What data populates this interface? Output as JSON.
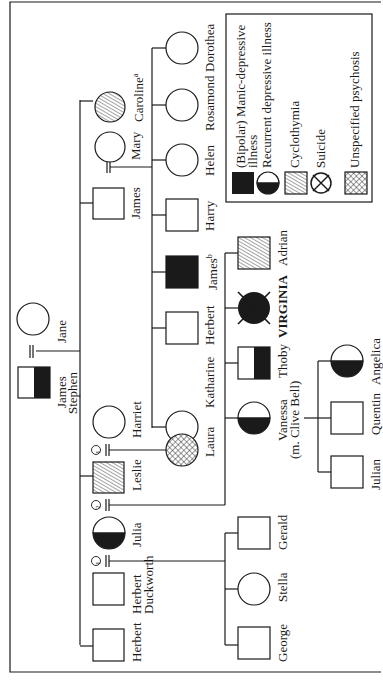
{
  "legend": {
    "items": [
      {
        "symbol": "filled-square",
        "label_line1": "(Bipolar) Manic-depressive",
        "label_line2": "illness"
      },
      {
        "symbol": "half-filled-circle",
        "label_line1": "Recurrent depressive illness"
      },
      {
        "symbol": "hatched-square",
        "label_line1": "Cyclothymia"
      },
      {
        "symbol": "crossed-circle",
        "label_line1": "Suicide"
      },
      {
        "symbol": "crosshatched-square",
        "label_line1": "Unspecified psychosis"
      }
    ]
  },
  "people": {
    "james_stephen": {
      "name1": "James",
      "name2": "Stephen",
      "sex": "male",
      "status": "recurrent-depressive"
    },
    "jane": {
      "name": "Jane",
      "sex": "female",
      "status": "unaffected"
    },
    "caroline": {
      "name": "Caroline",
      "sup": "a",
      "sex": "female",
      "status": "cyclothymia"
    },
    "mary": {
      "name": "Mary",
      "sex": "female",
      "status": "unaffected"
    },
    "james": {
      "name": "James",
      "sex": "male",
      "status": "unaffected"
    },
    "harriet": {
      "name": "Harriet",
      "sex": "female",
      "status": "unaffected"
    },
    "leslie": {
      "name": "Leslie",
      "sex": "male",
      "status": "cyclothymia"
    },
    "julia": {
      "name": "Julia",
      "sex": "female",
      "status": "recurrent-depressive"
    },
    "herbert_duckworth": {
      "name1": "Herbert",
      "name2": "Duckworth",
      "sex": "male",
      "status": "unaffected"
    },
    "herbert_sib": {
      "name": "Herbert",
      "sex": "male",
      "status": "unaffected"
    },
    "dorothea": {
      "name": "Dorothea",
      "sex": "female",
      "status": "unaffected"
    },
    "rosamond": {
      "name": "Rosamond",
      "sex": "female",
      "status": "unaffected"
    },
    "helen": {
      "name": "Helen",
      "sex": "female",
      "status": "unaffected"
    },
    "harry": {
      "name": "Harry",
      "sex": "male",
      "status": "unaffected"
    },
    "james_b": {
      "name": "James",
      "sup": "b",
      "sex": "male",
      "status": "manic-depressive"
    },
    "herbert": {
      "name": "Herbert",
      "sex": "male",
      "status": "unaffected"
    },
    "katharine": {
      "name": "Katharine",
      "sex": "female",
      "status": "unaffected"
    },
    "laura": {
      "name": "Laura",
      "sex": "female",
      "status": "unspecified-psychosis"
    },
    "adrian": {
      "name": "Adrian",
      "sex": "male",
      "status": "cyclothymia"
    },
    "virginia": {
      "name": "VIRGINIA",
      "sex": "female",
      "status": "manic-depressive-suicide"
    },
    "thoby": {
      "name": "Thoby",
      "sex": "male",
      "status": "recurrent-depressive"
    },
    "vanessa": {
      "name1": "Vanessa",
      "name2": "(m. Clive Bell)",
      "sex": "female",
      "status": "recurrent-depressive"
    },
    "angelica": {
      "name": "Angelica",
      "sex": "female",
      "status": "recurrent-depressive"
    },
    "quentin": {
      "name": "Quentin",
      "sex": "male",
      "status": "unaffected"
    },
    "julian": {
      "name": "Julian",
      "sex": "male",
      "status": "unaffected"
    },
    "gerald": {
      "name": "Gerald",
      "sex": "male",
      "status": "unaffected"
    },
    "stella": {
      "name": "Stella",
      "sex": "female",
      "status": "unaffected"
    },
    "george": {
      "name": "George",
      "sex": "male",
      "status": "unaffected"
    }
  },
  "marriage_numbers": {
    "leslie_harriet": "1",
    "leslie_julia": "2",
    "julia_duckworth": "1"
  },
  "colors": {
    "ink": "#1a1a1a",
    "paper": "#ffffff"
  }
}
